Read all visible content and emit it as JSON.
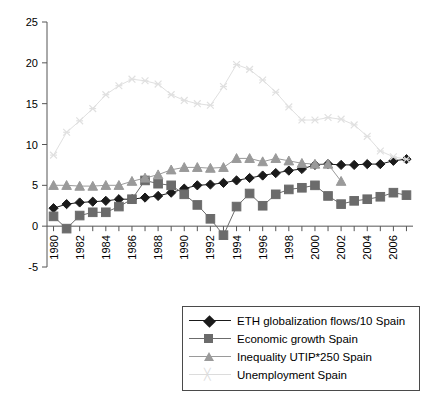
{
  "chart_data": {
    "type": "line",
    "title": "",
    "subtitle": "",
    "xlabel": "",
    "ylabel": "",
    "xlim": [
      1979.5,
      2007.5
    ],
    "ylim": [
      -5,
      25
    ],
    "yticks": [
      25,
      20,
      15,
      10,
      5,
      0,
      -5
    ],
    "grid": false,
    "legend_position": "bottom",
    "x": [
      1980,
      1981,
      1982,
      1983,
      1984,
      1985,
      1986,
      1987,
      1988,
      1989,
      1990,
      1991,
      1992,
      1993,
      1994,
      1995,
      1996,
      1997,
      1998,
      1999,
      2000,
      2001,
      2002,
      2003,
      2004,
      2005,
      2006,
      2007
    ],
    "xtick_labels": [
      "1980",
      "1982",
      "1984",
      "1986",
      "1988",
      "1990",
      "1992",
      "1994",
      "1996",
      "1998",
      "2000",
      "2002",
      "2004",
      "2006"
    ],
    "series": [
      {
        "name": "ETH globalization flows/10 Spain",
        "marker": "diamond",
        "color": "#1a1a1a",
        "values": [
          2.2,
          2.7,
          2.9,
          3.0,
          3.1,
          3.3,
          3.3,
          3.5,
          3.7,
          4.1,
          4.6,
          5.0,
          5.1,
          5.3,
          5.6,
          5.9,
          6.2,
          6.5,
          6.8,
          7.0,
          7.5,
          7.6,
          7.5,
          7.5,
          7.6,
          7.6,
          8.0,
          8.2
        ]
      },
      {
        "name": "Economic growth Spain",
        "marker": "square",
        "color": "#6b6b6b",
        "values": [
          1.2,
          -0.3,
          1.3,
          1.7,
          1.7,
          2.4,
          3.3,
          5.6,
          5.2,
          5.0,
          3.9,
          2.6,
          0.9,
          -1.1,
          2.4,
          4.0,
          2.5,
          3.9,
          4.5,
          4.7,
          5.0,
          3.7,
          2.7,
          3.1,
          3.3,
          3.6,
          4.1,
          3.8
        ]
      },
      {
        "name": "Inequality UTIP*250 Spain",
        "marker": "triangle",
        "color": "#9a9a9a",
        "values": [
          5.0,
          5.0,
          4.9,
          4.9,
          5.0,
          5.0,
          5.5,
          5.9,
          6.3,
          6.9,
          7.2,
          7.2,
          7.1,
          7.2,
          8.3,
          8.3,
          7.9,
          8.3,
          8.0,
          7.7,
          7.6,
          7.6,
          5.5,
          null,
          null,
          null,
          null,
          null
        ]
      },
      {
        "name": "Unemployment Spain",
        "marker": "x",
        "color": "#e0e0e0",
        "values": [
          8.7,
          11.5,
          12.9,
          14.4,
          16.1,
          17.2,
          18.0,
          17.8,
          17.4,
          16.1,
          15.4,
          15.0,
          14.8,
          17.1,
          19.8,
          19.2,
          17.9,
          16.4,
          14.6,
          13.0,
          13.0,
          13.3,
          13.1,
          12.4,
          11.0,
          9.2,
          8.5,
          8.2
        ]
      }
    ]
  },
  "legend": {
    "items": [
      {
        "label": "ETH globalization flows/10 Spain",
        "marker": "diamond",
        "color": "#1a1a1a"
      },
      {
        "label": "Economic growth Spain",
        "marker": "square",
        "color": "#6b6b6b"
      },
      {
        "label": "Inequality UTIP*250 Spain",
        "marker": "triangle",
        "color": "#9a9a9a"
      },
      {
        "label": "Unemployment Spain",
        "marker": "x",
        "color": "#dcdcdc"
      }
    ]
  }
}
